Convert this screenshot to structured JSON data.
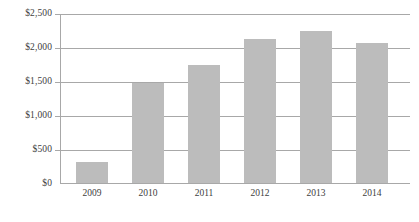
{
  "chart_data": {
    "type": "bar",
    "title": "",
    "subtitle": "",
    "xlabel": "",
    "ylabel": "",
    "categories": [
      "2009",
      "2010",
      "2011",
      "2012",
      "2013",
      "2014"
    ],
    "values": [
      325,
      1490,
      1755,
      2130,
      2250,
      2070
    ],
    "ylim": [
      0,
      2500
    ],
    "ytick_values": [
      0,
      500,
      1000,
      1500,
      2000,
      2500
    ],
    "ytick_labels": [
      "$0",
      "$500",
      "$1,000",
      "$1,500",
      "$2,000",
      "$2,500"
    ],
    "grid": true,
    "legend": false,
    "legend_position": "none",
    "series": [
      {
        "name": "",
        "values": [
          325,
          1490,
          1755,
          2130,
          2250,
          2070
        ],
        "color": "#bcbcbc"
      }
    ]
  },
  "colors": {
    "bar_fill": "#bcbcbc",
    "gridline": "#a8a8a8",
    "axis": "#a8a8a8",
    "text": "#404040",
    "background": "#ffffff"
  }
}
